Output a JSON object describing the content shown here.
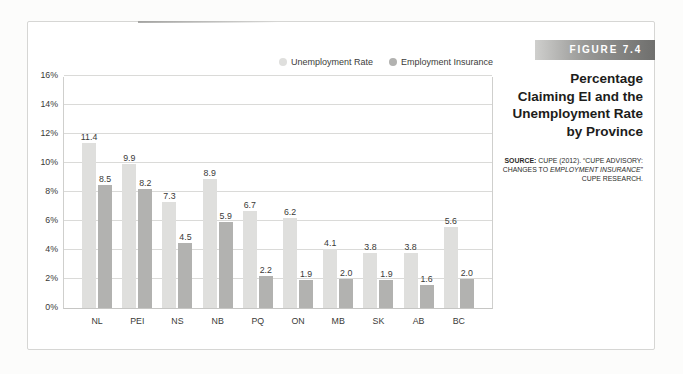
{
  "figure": {
    "label": "FIGURE 7.4",
    "title_lines": [
      "Percentage",
      "Claiming EI and the",
      "Unemployment Rate",
      "by Province"
    ],
    "source_label": "SOURCE:",
    "source_part1": " CUPE (2012). “CUPE ADVISORY: CHANGES TO ",
    "source_italic": "EMPLOYMENT INSURANCE",
    "source_part2": "” CUPE RESEARCH."
  },
  "chart_data": {
    "type": "bar",
    "title": "Percentage Claiming EI and the Unemployment Rate by Province",
    "categories": [
      "NL",
      "PEI",
      "NS",
      "NB",
      "PQ",
      "ON",
      "MB",
      "SK",
      "AB",
      "BC"
    ],
    "series": [
      {
        "name": "Unemployment Rate",
        "color": "#dfdfdd",
        "values": [
          11.4,
          9.9,
          7.3,
          8.9,
          6.7,
          6.2,
          4.1,
          3.8,
          3.8,
          5.6
        ]
      },
      {
        "name": "Employment Insurance",
        "color": "#b2b2b0",
        "values": [
          8.5,
          8.2,
          4.5,
          5.9,
          2.2,
          1.9,
          2.0,
          1.9,
          1.6,
          2.0
        ]
      }
    ],
    "xlabel": "",
    "ylabel": "",
    "ylim": [
      0,
      16
    ],
    "ytick_step": 2,
    "ytick_suffix": "%",
    "grid": true,
    "legend_position": "top-right",
    "value_labels": true,
    "value_label_decimals": 1,
    "gridline_color": "#dadad8",
    "text_color": "#3a3a38"
  }
}
